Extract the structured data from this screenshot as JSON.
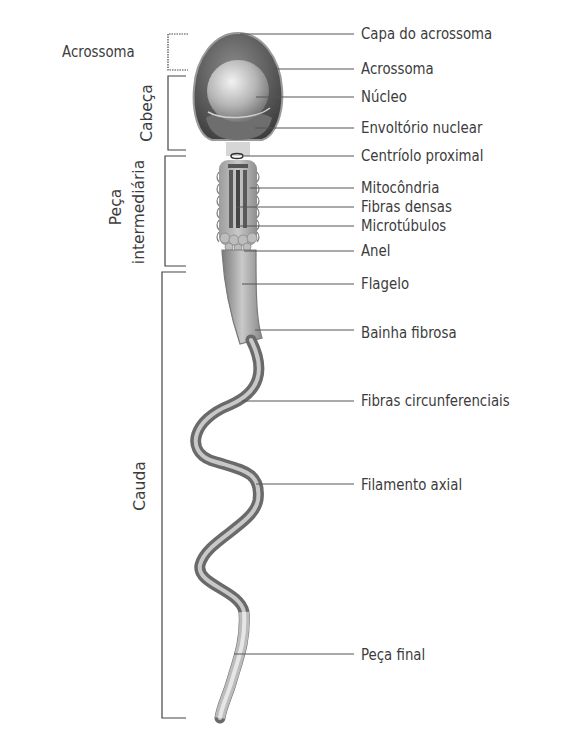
{
  "diagram": {
    "right_labels": [
      {
        "text": "Capa do acrossoma",
        "y": 34
      },
      {
        "text": "Acrossoma",
        "y": 69
      },
      {
        "text": "Núcleo",
        "y": 97
      },
      {
        "text": "Envoltório nuclear",
        "y": 128
      },
      {
        "text": "Centríolo proximal",
        "y": 156
      },
      {
        "text": "Mitocôndria",
        "y": 188
      },
      {
        "text": "Fibras densas",
        "y": 207
      },
      {
        "text": "Microtúbulos",
        "y": 226
      },
      {
        "text": "Anel",
        "y": 251
      },
      {
        "text": "Flagelo",
        "y": 284
      },
      {
        "text": "Bainha fibrosa",
        "y": 333
      },
      {
        "text": "Fibras circunferenciais",
        "y": 401
      },
      {
        "text": "Filamento axial",
        "y": 485
      },
      {
        "text": "Peça final",
        "y": 655
      }
    ],
    "left_groups": [
      {
        "text": "Acrossoma",
        "orientation": "horizontal",
        "top": 34,
        "bottom": 70
      },
      {
        "text": "Cabeça",
        "orientation": "vertical",
        "top": 76,
        "bottom": 150
      },
      {
        "text": "Peça",
        "text2": "intermediária",
        "orientation": "vertical",
        "top": 156,
        "bottom": 266
      },
      {
        "text": "Cauda",
        "orientation": "vertical",
        "top": 272,
        "bottom": 718
      }
    ],
    "colors": {
      "text": "#3c3c3c",
      "leader_line": "#555555",
      "head_outer": "#5a5a5a",
      "nucleus": "#b0b0b0",
      "midpiece": "#9a9a9a",
      "tail": "#8a8a8a"
    }
  }
}
